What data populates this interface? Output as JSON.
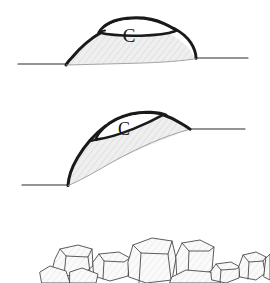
{
  "figure": {
    "title": "",
    "background_color": "#ffffff",
    "panels": [
      {
        "id": "panel-a",
        "name": "dome-on-horizontal-ground",
        "label": "C",
        "label_name": "core-label-c",
        "description": "Hatched dome-shaped mass resting on a horizontal ground line, with a thin lens-shaped cap outlined at the crest labelled C",
        "ground_line_left_y": 64,
        "ground_line_right_y": 58
      },
      {
        "id": "panel-b",
        "name": "dome-on-inclined-ground",
        "label": "C",
        "label_name": "core-label-c",
        "description": "The same hatched mass tilted along an inclined ground surface, the lens-shaped cap labelled C now displaced to the upslope flank",
        "ground_line_left_y": 185,
        "ground_line_right_y": 129
      },
      {
        "id": "panel-c",
        "name": "boulder-cluster",
        "label": "",
        "description": "Cluster of angular faceted corestones / boulders forming a blockfield at the ground surface"
      }
    ],
    "colors": {
      "outline": "#1a1a1a",
      "thin_outline": "#3c3c3c",
      "fill": "#eeeeee",
      "hatch": "#d8d8d8",
      "ground_line": "#2b2b2b",
      "rock_outline": "#4a4a4a",
      "rock_fill": "#f4f4f4",
      "white": "#ffffff"
    },
    "stroke_widths": {
      "heavy_outline": 3.2,
      "medium_outline": 1.6,
      "ground_line": 1.2,
      "rock_outline": 0.9,
      "hatch": 0.6
    }
  }
}
